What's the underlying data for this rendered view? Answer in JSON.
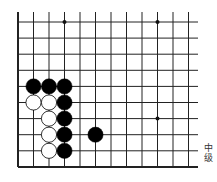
{
  "board": {
    "origin_x": 18,
    "origin_y": 22,
    "spacing_x": 15.5,
    "spacing_y": 16.1,
    "columns": 12,
    "rows": 10,
    "line_end_x": 198,
    "line_start_y": 12,
    "line_color": "#222222",
    "edges": [
      "left",
      "bottom"
    ],
    "star_points": [
      [
        3,
        0
      ],
      [
        9,
        0
      ],
      [
        9,
        6
      ]
    ],
    "stones": [
      {
        "color": "black",
        "col": 1,
        "row": 4
      },
      {
        "color": "black",
        "col": 2,
        "row": 4
      },
      {
        "color": "black",
        "col": 3,
        "row": 4
      },
      {
        "color": "white",
        "col": 1,
        "row": 5
      },
      {
        "color": "white",
        "col": 2,
        "row": 5
      },
      {
        "color": "black",
        "col": 3,
        "row": 5
      },
      {
        "color": "white",
        "col": 2,
        "row": 6
      },
      {
        "color": "black",
        "col": 3,
        "row": 6
      },
      {
        "color": "white",
        "col": 2,
        "row": 7
      },
      {
        "color": "black",
        "col": 3,
        "row": 7
      },
      {
        "color": "black",
        "col": 5,
        "row": 7
      },
      {
        "color": "white",
        "col": 2,
        "row": 8
      },
      {
        "color": "black",
        "col": 3,
        "row": 8
      }
    ]
  },
  "caption": {
    "line1": "中",
    "line2": "级"
  }
}
